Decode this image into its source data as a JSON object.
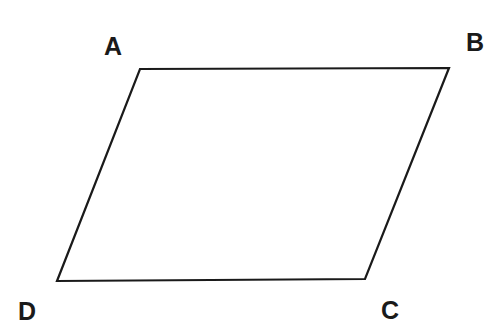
{
  "diagram": {
    "type": "parallelogram",
    "vertices": [
      {
        "label": "A",
        "x": 140,
        "y": 69
      },
      {
        "label": "B",
        "x": 449,
        "y": 68
      },
      {
        "label": "C",
        "x": 365,
        "y": 279
      },
      {
        "label": "D",
        "x": 57,
        "y": 281
      }
    ],
    "stroke_color": "#1a1a1a",
    "background": "#ffffff"
  }
}
